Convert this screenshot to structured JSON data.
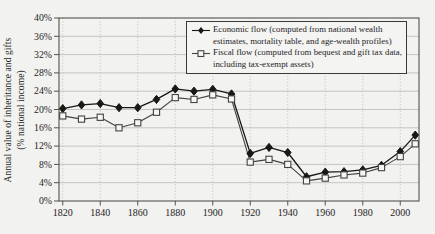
{
  "figure": {
    "background_color": "#f2f2f0",
    "ink_color": "#26241f",
    "grid_color": "#b9b9b6",
    "border_color": "#55524d",
    "ylabel_line1": "Annual value of inheritance and gifts",
    "ylabel_line2": "(% national income)"
  },
  "legend": {
    "position": "top-right",
    "items": [
      {
        "id": "economic",
        "marker": "filled-diamond",
        "label": "Economic flow (computed from national wealth estimates, mortality table, and age-wealth profiles)"
      },
      {
        "id": "fiscal",
        "marker": "open-square",
        "label": "Fiscal flow (computed from bequest and gift tax data, including tax-exempt assets)"
      }
    ]
  },
  "chart_data": {
    "type": "line",
    "title": "",
    "xlabel": "",
    "ylabel": "Annual value of inheritance and gifts (% national income)",
    "x": [
      1820,
      1830,
      1840,
      1850,
      1860,
      1870,
      1880,
      1890,
      1900,
      1910,
      1920,
      1930,
      1940,
      1950,
      1960,
      1970,
      1980,
      1990,
      2000,
      2008
    ],
    "series": [
      {
        "name": "Economic flow (computed from national wealth estimates, mortality table, and age-wealth profiles)",
        "marker": "filled-diamond",
        "color": "#1a1815",
        "values": [
          20.2,
          21.0,
          21.3,
          20.4,
          20.4,
          22.2,
          24.5,
          24.0,
          24.4,
          23.4,
          10.4,
          11.7,
          10.6,
          5.3,
          6.3,
          6.4,
          6.8,
          7.8,
          10.8,
          14.4
        ]
      },
      {
        "name": "Fiscal flow (computed from bequest and gift tax data, including tax-exempt assets)",
        "marker": "open-square",
        "color": "#454340",
        "values": [
          18.6,
          17.9,
          18.3,
          16.0,
          17.1,
          19.4,
          22.6,
          22.2,
          23.2,
          22.3,
          8.5,
          9.1,
          8.0,
          4.4,
          5.0,
          5.7,
          6.1,
          7.3,
          9.7,
          12.5
        ]
      }
    ],
    "ylim": [
      0,
      40
    ],
    "yticks": [
      0,
      4,
      8,
      12,
      16,
      20,
      24,
      28,
      32,
      36,
      40
    ],
    "ytick_suffix": "%",
    "xlim": [
      1818,
      2010
    ],
    "xticks": [
      1820,
      1840,
      1860,
      1880,
      1900,
      1920,
      1940,
      1960,
      1980,
      2000
    ],
    "grid": {
      "horizontal": "solid",
      "vertical": "dotted"
    },
    "legend_position": "top-right"
  }
}
